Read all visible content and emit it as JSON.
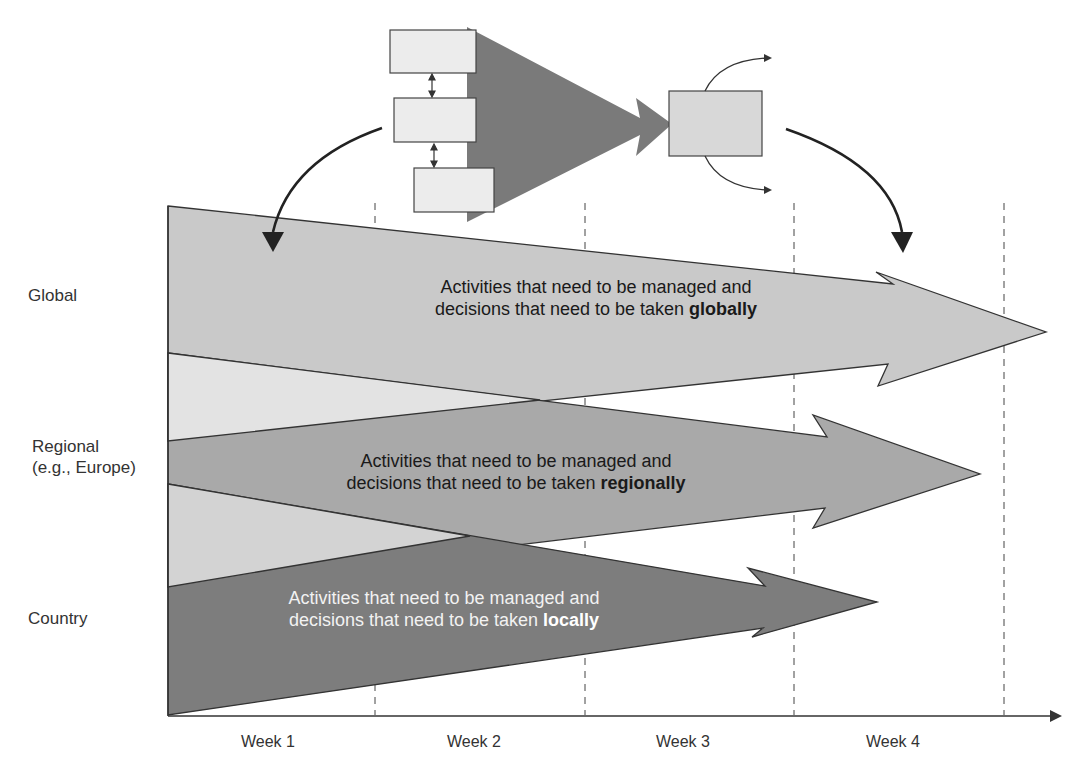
{
  "levels": [
    {
      "id": "global",
      "label": "Global",
      "line1": "Activities that need to be managed and",
      "line2_prefix": "decisions that need to be taken ",
      "line2_bold": "globally",
      "color": "#c9c9c9",
      "text_color": "#1a1a1a"
    },
    {
      "id": "regional",
      "label": "Regional",
      "label_line2": "(e.g., Europe)",
      "line1": "Activities that need to be managed and",
      "line2_prefix": "decisions that need to be taken ",
      "line2_bold": "regionally",
      "color": "#a9a9a9",
      "text_color": "#1a1a1a"
    },
    {
      "id": "country",
      "label": "Country",
      "line1": "Activities that need to be managed and",
      "line2_prefix": "decisions that need to be taken ",
      "line2_bold": "locally",
      "color": "#7d7d7d",
      "text_color": "#f2f2f2"
    }
  ],
  "x_axis": {
    "ticks": [
      "Week 1",
      "Week 2",
      "Week 3",
      "Week 4"
    ]
  },
  "colors": {
    "overlap_upper": "#e3e3e3",
    "overlap_lower": "#d3d3d3",
    "stroke": "#333333",
    "box_fill": "#ececec",
    "funnel": "#7a7a7a",
    "merged_box": "#d8d8d8"
  },
  "top_diagram": {
    "input_boxes": 3,
    "output_box": 1,
    "output_arrows": 2
  }
}
